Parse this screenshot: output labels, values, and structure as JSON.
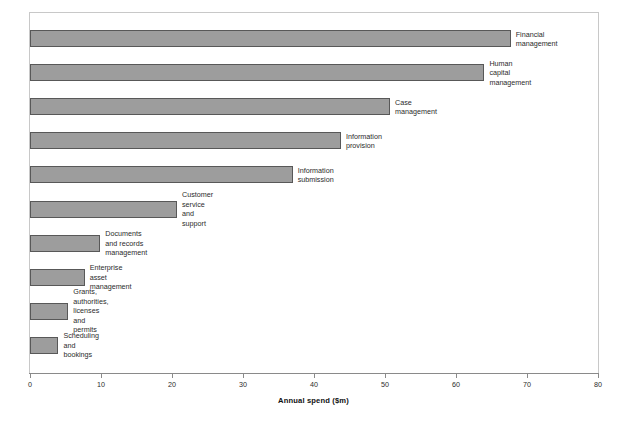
{
  "chart_data": {
    "type": "bar",
    "orientation": "horizontal",
    "title": "",
    "xlabel": "Annual spend ($m)",
    "ylabel": "",
    "xlim": [
      0,
      80
    ],
    "xticks": [
      0,
      10,
      20,
      30,
      40,
      50,
      60,
      70,
      80
    ],
    "grid": false,
    "legend": null,
    "categories": [
      "Financial management",
      "Human capital management",
      "Case management",
      "Information provision",
      "Information submission",
      "Customer service and support",
      "Documents and records\nmanagement",
      "Enterprise asset management",
      "Grants, authorities, licenses and\npermits",
      "Scheduling and bookings"
    ],
    "values": [
      67.7,
      64.0,
      50.7,
      43.8,
      37.0,
      20.7,
      9.9,
      7.7,
      5.4,
      4.0
    ],
    "bar_color": "#9d9d9d",
    "bar_border_color": "#585858",
    "frame_color": "#c8c8c8",
    "axis_color": "#8a8a8a"
  }
}
